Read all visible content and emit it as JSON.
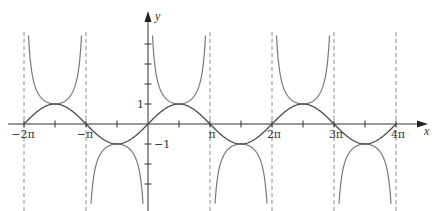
{
  "chart_data": {
    "type": "line",
    "title": "",
    "xlabel": "x",
    "ylabel": "y",
    "xlim": [
      "-2π",
      "4π"
    ],
    "ylim": [
      -4.5,
      4.6
    ],
    "grid": false,
    "legend": null,
    "x_tick_labels": [
      "−2π",
      "−π",
      "π",
      "2π",
      "3π",
      "4π"
    ],
    "x_tick_values_in_pi": [
      -2,
      -1.5,
      -1,
      -0.5,
      0.5,
      1,
      1.5,
      2,
      2.5,
      3,
      3.5,
      4
    ],
    "y_tick_labels": [
      "1",
      "−1"
    ],
    "y_tick_values": [
      4,
      3,
      2,
      1,
      -1,
      -2,
      -3
    ],
    "series": [
      {
        "name": "y = sin x",
        "function": "sin(x)",
        "style": "solid",
        "color": "#4a4a4a",
        "x_in_pi": [
          -2,
          -1.5,
          -1,
          -0.5,
          0,
          0.5,
          1,
          1.5,
          2,
          2.5,
          3,
          3.5,
          4
        ],
        "values": [
          0,
          1,
          0,
          -1,
          0,
          1,
          0,
          -1,
          0,
          1,
          0,
          -1,
          0
        ]
      },
      {
        "name": "y = csc x",
        "function": "1/sin(x)",
        "style": "solid",
        "color": "#7a7a7a",
        "local_extrema_x_in_pi": [
          -1.5,
          -0.5,
          0.5,
          1.5,
          2.5,
          3.5
        ],
        "local_extrema_values": [
          1,
          -1,
          1,
          -1,
          1,
          -1
        ]
      },
      {
        "name": "vertical asymptotes",
        "style": "dashed",
        "color": "#888888",
        "x_in_pi": [
          -2,
          -1,
          0,
          1,
          2,
          3,
          4
        ]
      }
    ],
    "annotations": []
  },
  "axes": {
    "x_label": "x",
    "y_label": "y",
    "x_ticks": [
      {
        "label": "−2π",
        "pi": -2
      },
      {
        "label": "−π",
        "pi": -1
      },
      {
        "label": "π",
        "pi": 1
      },
      {
        "label": "2π",
        "pi": 2
      },
      {
        "label": "3π",
        "pi": 3
      },
      {
        "label": "4π",
        "pi": 4
      }
    ],
    "y_ticks": [
      {
        "label": "1",
        "value": 1
      },
      {
        "label": "−1",
        "value": -1
      }
    ]
  },
  "colors": {
    "axis": "#333333",
    "sin": "#4a4a4a",
    "csc": "#7a7a7a",
    "asymptote": "#8c8c8c"
  }
}
